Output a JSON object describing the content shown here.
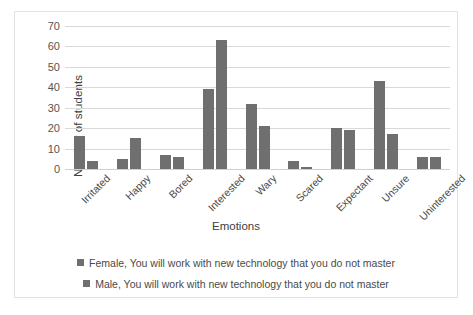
{
  "chart_data": {
    "type": "bar",
    "title": "",
    "xlabel": "Emotions",
    "ylabel": "Number of students",
    "categories": [
      "Irritated",
      "Happy",
      "Bored",
      "Interested",
      "Wary",
      "Scared",
      "Expectant",
      "Unsure",
      "Uninterested"
    ],
    "series": [
      {
        "name": "Female, You will work with new technology that you do not master",
        "color": "#706f6f",
        "values": [
          16,
          5,
          7,
          39,
          32,
          4,
          20,
          43,
          6
        ]
      },
      {
        "name": "Male, You will work with new technology that you do not master",
        "color": "#706f6f",
        "values": [
          4,
          15,
          6,
          63,
          21,
          1,
          19,
          17,
          6
        ]
      }
    ],
    "ylim": [
      0,
      70
    ],
    "yticks": [
      0,
      10,
      20,
      30,
      40,
      50,
      60,
      70
    ],
    "grid": true,
    "legend_position": "bottom"
  },
  "axes": {
    "y_title": "Number of students",
    "x_title": "Emotions"
  },
  "legend": {
    "entries": [
      {
        "label": "Female, You will work with new technology that you do not master"
      },
      {
        "label": "Male, You will work with new technology that you do not master"
      }
    ]
  },
  "colors": {
    "bar": "#706f6f",
    "grid": "#d9d9d9",
    "frame": "#e2e2e2",
    "text": "#4a4a4a"
  }
}
